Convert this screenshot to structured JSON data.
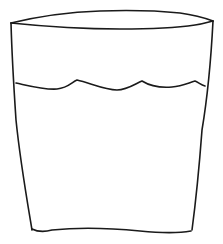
{
  "drawing": {
    "subject": "glass of water sketch",
    "stroke_color": "#1a1a1a",
    "background": "#ffffff",
    "paths": {
      "rim_top": "M11,23 C40,16 70,12 100,11 C130,10 160,11 180,13 C195,15 205,18 213,21",
      "rim_bottom": "M11,23 C40,26 80,29 120,29 C150,29 175,28 195,25 C203,24 209,22 213,21",
      "left_side": "M11,23 C12,60 14,90 16,120 C20,160 27,200 32,230",
      "right_side": "M213,21 C211,60 207,100 202,130 C199,170 196,200 192,230",
      "water_line": "M16,83 C30,86 45,90 57,89 C68,88 72,82 77,80 C90,83 105,90 117,90 C127,90 135,84 142,81 C150,86 160,88 172,87 C182,86 188,83 195,81 C198,82 201,85 205,86",
      "bottom": "M32,229 C38,232 45,232 52,230 C80,227 110,228 140,231 C160,233 180,233 191,231"
    }
  }
}
